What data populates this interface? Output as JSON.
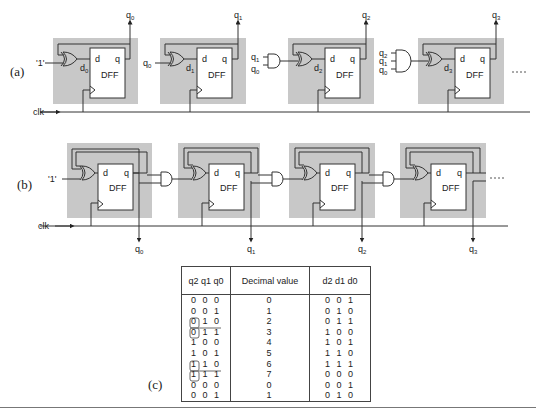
{
  "diagram": {
    "part_a": {
      "label": "(a)",
      "input_one": "'1'",
      "clk_label": "clk",
      "ellipsis": "----",
      "stages": [
        {
          "d_label": "d0",
          "q_label": "q0",
          "dff": "DFF",
          "pin_d": "d",
          "pin_q": "q",
          "input": "'1'"
        },
        {
          "d_label": "d1",
          "q_label": "q1",
          "dff": "DFF",
          "pin_d": "d",
          "pin_q": "q",
          "input": "q0"
        },
        {
          "d_label": "d2",
          "q_label": "q2",
          "dff": "DFF",
          "pin_d": "d",
          "pin_q": "q",
          "and_inputs": [
            "q1",
            "q0"
          ]
        },
        {
          "d_label": "d3",
          "q_label": "q3",
          "dff": "DFF",
          "pin_d": "d",
          "pin_q": "q",
          "and_inputs": [
            "q2",
            "q1",
            "q0"
          ]
        }
      ]
    },
    "part_b": {
      "label": "(b)",
      "input_one": "'1'",
      "clk_label": "clk",
      "ellipsis": "----",
      "outputs": [
        "q0",
        "q1",
        "q2",
        "q3"
      ],
      "dff": "DFF"
    },
    "part_c": {
      "label": "(c)",
      "table": {
        "headers": [
          "q2 q1 q0",
          "Decimal value",
          "d2 d1 d0"
        ],
        "rows": [
          [
            "0 0 0",
            "0",
            "0 0 1"
          ],
          [
            "0 0 1",
            "1",
            "0 1 0"
          ],
          [
            "0 1 0",
            "2",
            "0 1 1"
          ],
          [
            "0 1 1",
            "3",
            "1 0 0"
          ],
          [
            "1 0 0",
            "4",
            "1 0 1"
          ],
          [
            "1 0 1",
            "5",
            "1 1 0"
          ],
          [
            "1 1 0",
            "6",
            "1 1 1"
          ],
          [
            "1 1 1",
            "7",
            "0 0 0"
          ],
          [
            "0 0 0",
            "0",
            "0 0 1"
          ],
          [
            "0 0 1",
            "1",
            "0 1 0"
          ]
        ]
      }
    }
  },
  "colors": {
    "module_fill": "#c8c8c8",
    "line": "#333333",
    "dff_fill": "#ffffff"
  }
}
